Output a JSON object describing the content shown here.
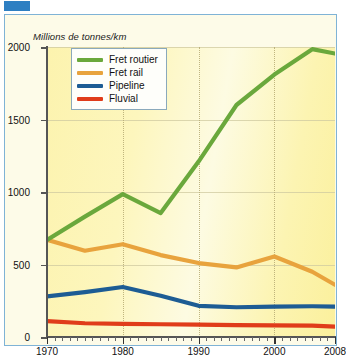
{
  "figure": {
    "tab_marker_color": "#2e7fc2",
    "frame_border_color": "#7fb3d6"
  },
  "chart_data": {
    "type": "line",
    "title": "Millions de tonnes/km",
    "xlabel": "",
    "ylabel": "Millions de tonnes/km",
    "xlim": [
      1970,
      2008
    ],
    "ylim": [
      0,
      2000
    ],
    "yticks": [
      0,
      500,
      1000,
      1500,
      2000
    ],
    "ytick_labels": [
      "0",
      "500",
      "1000",
      "1500",
      "2000"
    ],
    "xticks": [
      1970,
      1980,
      1990,
      2000,
      2008
    ],
    "xtick_labels": [
      "1970",
      "1980",
      "1990",
      "2000",
      "2008"
    ],
    "grid": "horizontal-solid-and-vertical-dotted",
    "legend_position": "top-left-inside",
    "x": [
      1970,
      1975,
      1980,
      1985,
      1990,
      1995,
      2000,
      2005,
      2008
    ],
    "series": [
      {
        "name": "Fret routier",
        "color": "#6aa83c",
        "values": [
          670,
          830,
          985,
          855,
          1210,
          1600,
          1810,
          1985,
          1955
        ]
      },
      {
        "name": "Fret rail",
        "color": "#e8a33d",
        "values": [
          670,
          595,
          640,
          565,
          510,
          480,
          555,
          450,
          360
        ]
      },
      {
        "name": "Pipeline",
        "color": "#1d5c94",
        "values": [
          280,
          310,
          345,
          285,
          215,
          205,
          210,
          212,
          210
        ]
      },
      {
        "name": "Fluvial",
        "color": "#e03c1a",
        "values": [
          110,
          95,
          90,
          88,
          85,
          82,
          80,
          78,
          72
        ]
      }
    ]
  },
  "legend": {
    "items": [
      {
        "label": "Fret routier",
        "color": "#6aa83c"
      },
      {
        "label": "Fret rail",
        "color": "#e8a33d"
      },
      {
        "label": "Pipeline",
        "color": "#1d5c94"
      },
      {
        "label": "Fluvial",
        "color": "#e03c1a"
      }
    ]
  }
}
